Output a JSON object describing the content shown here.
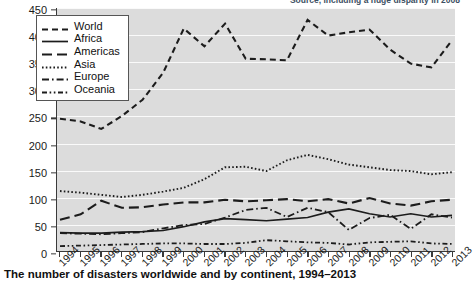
{
  "source_note": "Source, including a huge disparity in 2008",
  "caption": "The number of disasters worldwide and by continent, 1994–2013",
  "legend": {
    "items": [
      {
        "label": "World",
        "style": "dashed"
      },
      {
        "label": "Africa",
        "style": "solid"
      },
      {
        "label": "Americas",
        "style": "long-dash"
      },
      {
        "label": "Asia",
        "style": "dotted"
      },
      {
        "label": "Europe",
        "style": "dash-dot"
      },
      {
        "label": "Oceania",
        "style": "dash-dot-dot"
      }
    ]
  },
  "chart_data": {
    "type": "line",
    "title": "The number of disasters worldwide and by continent, 1994–2013",
    "xlabel": "",
    "ylabel": "",
    "ylim": [
      0,
      450
    ],
    "yticks": [
      0,
      50,
      100,
      150,
      200,
      250,
      300,
      350,
      400,
      450
    ],
    "grid": true,
    "legend_position": "top-left",
    "categories": [
      "1994",
      "1995",
      "1996",
      "1997",
      "1998",
      "1999",
      "2000",
      "2001",
      "2002",
      "2003",
      "2004",
      "2005",
      "2006",
      "2007",
      "2008",
      "2009",
      "2010",
      "2011",
      "2012",
      "2013"
    ],
    "series": [
      {
        "name": "World",
        "dash": "dashed",
        "values": [
          245,
          240,
          226,
          250,
          280,
          330,
          412,
          379,
          421,
          356,
          355,
          353,
          428,
          399,
          405,
          410,
          373,
          347,
          340,
          390
        ]
      },
      {
        "name": "Africa",
        "dash": "solid",
        "values": [
          34,
          33,
          33,
          35,
          36,
          38,
          45,
          54,
          60,
          58,
          56,
          59,
          62,
          72,
          78,
          69,
          63,
          69,
          63,
          66
        ]
      },
      {
        "name": "Americas",
        "dash": "long-dash",
        "values": [
          58,
          68,
          93,
          80,
          81,
          86,
          90,
          90,
          95,
          92,
          94,
          96,
          92,
          96,
          88,
          98,
          88,
          84,
          92,
          95
        ]
      },
      {
        "name": "Asia",
        "dash": "dotted",
        "values": [
          111,
          108,
          104,
          100,
          104,
          110,
          117,
          133,
          155,
          156,
          148,
          168,
          178,
          170,
          160,
          155,
          150,
          148,
          142,
          146
        ]
      },
      {
        "name": "Europe",
        "dash": "dash-dot",
        "values": [
          33,
          32,
          31,
          33,
          35,
          42,
          48,
          50,
          62,
          76,
          80,
          63,
          80,
          72,
          39,
          61,
          67,
          41,
          68,
          62
        ]
      },
      {
        "name": "Oceania",
        "dash": "dash-dot-dot",
        "values": [
          9,
          10,
          11,
          12,
          13,
          14,
          14,
          13,
          13,
          15,
          20,
          18,
          16,
          15,
          12,
          16,
          17,
          18,
          14,
          13
        ]
      }
    ]
  }
}
